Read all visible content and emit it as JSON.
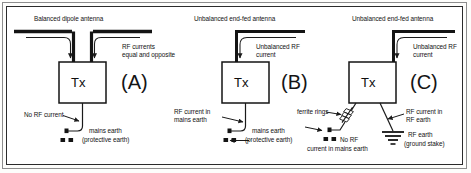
{
  "figure": {
    "colors": {
      "ink": "#121212",
      "wire": "#1a1a1a",
      "frame_outer": "#8d8d8d",
      "frame_inner": "#2b2b2b",
      "paper": "#ffffff"
    }
  },
  "panels": [
    {
      "id": "A",
      "letter": "(A)",
      "tx_label": "Tx",
      "antenna_title": "Balanced dipole antenna",
      "current_label": "RF currents\nequal and opposite",
      "earth_current_label": "No RF current",
      "earth_label_line1": "mains earth",
      "earth_label_line2": "(protective earth)",
      "earth_symbol": "mains-earth-symbol"
    },
    {
      "id": "B",
      "letter": "(B)",
      "tx_label": "Tx",
      "antenna_title": "Unbalanced end-fed antenna",
      "current_label": "Unbalanced RF\ncurrent",
      "earth_current_label": "RF current in\nmains earth",
      "earth_label_line1": "mains earth",
      "earth_label_line2": "(protective earth)",
      "earth_symbol": "mains-earth-symbol"
    },
    {
      "id": "C",
      "letter": "(C)",
      "tx_label": "Tx",
      "antenna_title": "Unbalanced end-fed antenna",
      "current_label": "Unbalanced RF\ncurrent",
      "ferrite_label": "ferrite rings",
      "no_rf_label_line1": "No RF",
      "no_rf_label_line2": "current in mains earth",
      "rf_earth_current_label": "RF current in\nRF earth",
      "rf_earth_label_line1": "RF earth",
      "rf_earth_label_line2": "(ground stake)",
      "earth_symbol": "mains-earth-symbol",
      "rf_earth_symbol": "ground-stake-symbol"
    }
  ]
}
